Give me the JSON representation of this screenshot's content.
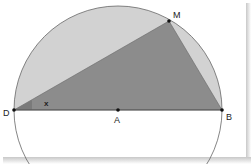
{
  "diagram": {
    "type": "geometry",
    "points": {
      "D": {
        "label": "D",
        "x": 14,
        "y": 110
      },
      "A": {
        "label": "A",
        "x": 118,
        "y": 110
      },
      "B": {
        "label": "B",
        "x": 222,
        "y": 110
      },
      "M": {
        "label": "M",
        "x": 169,
        "y": 21
      }
    },
    "angle_label": "x",
    "colors": {
      "semicircle_fill": "#d2d2d2",
      "triangle_fill": "#8c8c8c",
      "stroke": "#555555",
      "angle_marker": "#7a7a7a"
    }
  }
}
